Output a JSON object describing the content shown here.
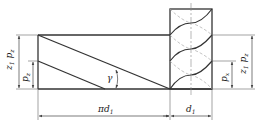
{
  "diagram": {
    "colors": {
      "line": "#333333",
      "thin": "#555555",
      "hidden": "#999999"
    },
    "labels": {
      "lead_left": {
        "main": "z",
        "sub1": "1",
        "main2": "p",
        "sub2": "z"
      },
      "pitch_left": {
        "main": "p",
        "sub": "z"
      },
      "lead_angle": "γ",
      "circumference": {
        "main": "πd",
        "sub": "1"
      },
      "diameter": {
        "main": "d",
        "sub": "1"
      },
      "pitch_right": {
        "main": "p",
        "sub": "x"
      },
      "lead_right": {
        "main": "z",
        "sub1": "1",
        "main2": "p",
        "sub2": "z"
      }
    }
  }
}
